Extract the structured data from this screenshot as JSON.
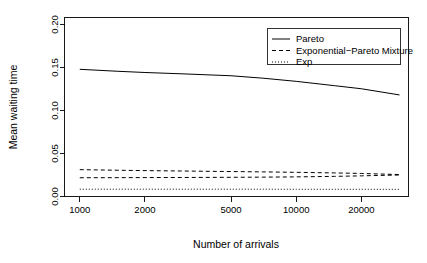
{
  "chart_data": {
    "type": "line",
    "title": "",
    "xlabel": "Number of arrivals",
    "ylabel": "Mean waiting time",
    "xscale": "log",
    "yscale": "linear",
    "xlim": [
      850,
      33000
    ],
    "ylim": [
      0.0,
      0.208
    ],
    "grid": false,
    "legend_position": "top-right",
    "xticks": [
      1000,
      2000,
      5000,
      10000,
      20000
    ],
    "xtick_labels": [
      "1000",
      "2000",
      "5000",
      "10000",
      "20000"
    ],
    "yticks": [
      0.0,
      0.05,
      0.1,
      0.15,
      0.2
    ],
    "ytick_labels": [
      "0.00",
      "0.05",
      "0.10",
      "0.15",
      "0.20"
    ],
    "x": [
      1000,
      1500,
      2000,
      3000,
      5000,
      7000,
      10000,
      15000,
      20000,
      30000
    ],
    "series": [
      {
        "name": "Pareto",
        "style": "solid",
        "values": [
          0.1478,
          0.1455,
          0.1441,
          0.1425,
          0.1403,
          0.1375,
          0.1338,
          0.1288,
          0.1252,
          0.118
        ]
      },
      {
        "name": "Exponential−Pareto Mixture",
        "style": "dashed",
        "values": [
          0.0312,
          0.0305,
          0.0301,
          0.0296,
          0.029,
          0.0286,
          0.0281,
          0.0274,
          0.0268,
          0.0255
        ]
      },
      {
        "name": "Exp",
        "style": "dotted",
        "values": [
          0.0085,
          0.0085,
          0.0085,
          0.0085,
          0.0085,
          0.0085,
          0.0084,
          0.0084,
          0.0084,
          0.0083
        ]
      }
    ],
    "extra_series": [
      {
        "name": "Exponential−Pareto Mixture lower",
        "style": "dashed",
        "values": [
          0.0218,
          0.0219,
          0.022,
          0.0221,
          0.0223,
          0.0225,
          0.0228,
          0.0234,
          0.024,
          0.025
        ]
      }
    ]
  },
  "legend": {
    "entries": [
      {
        "label": "Pareto",
        "style": "solid"
      },
      {
        "label": "Exponential−Pareto Mixture",
        "style": "dashed"
      },
      {
        "label": "Exp",
        "style": "dotted"
      }
    ]
  }
}
